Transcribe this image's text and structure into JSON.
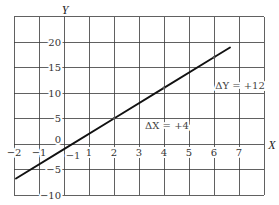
{
  "chart_data": {
    "type": "line",
    "title": "",
    "xlabel": "X",
    "ylabel": "Y",
    "xlim": [
      -2,
      8
    ],
    "ylim": [
      -10,
      25
    ],
    "grid": true,
    "grid_x_step": 1,
    "grid_y_step": 5,
    "x_ticks": [
      {
        "value": -2,
        "label": "−2"
      },
      {
        "value": -1,
        "label": "−1"
      },
      {
        "value": 1,
        "label": "1"
      },
      {
        "value": 2,
        "label": "2"
      },
      {
        "value": 3,
        "label": "3"
      },
      {
        "value": 4,
        "label": "4"
      },
      {
        "value": 5,
        "label": "5"
      },
      {
        "value": 6,
        "label": "6"
      },
      {
        "value": 7,
        "label": "7"
      }
    ],
    "y_ticks": [
      {
        "value": 20,
        "label": "20"
      },
      {
        "value": 15,
        "label": "15"
      },
      {
        "value": 10,
        "label": "10"
      },
      {
        "value": 5,
        "label": "5"
      },
      {
        "value": 0,
        "label": "0"
      },
      {
        "value": -5,
        "label": "−5"
      },
      {
        "value": -10,
        "label": "−10"
      }
    ],
    "series": [
      {
        "name": "line",
        "color": "#111111",
        "x": [
          -1.92,
          0,
          2,
          4,
          6,
          6.64
        ],
        "y": [
          -6.76,
          -1,
          5,
          11,
          17,
          18.92
        ]
      }
    ],
    "marked_points": [
      {
        "x": 2,
        "y": 5
      },
      {
        "x": 4,
        "y": 11
      },
      {
        "x": 6,
        "y": 17
      }
    ],
    "annotations": [
      {
        "id": "delta-y",
        "text": "ΔY = +12",
        "x": 7.04,
        "y": 11.4
      },
      {
        "id": "delta-x",
        "text": "ΔX = +4",
        "x": 4.12,
        "y": 3.7
      },
      {
        "id": "y-intercept",
        "text": "−1",
        "x": 0.36,
        "y": -2.2
      }
    ],
    "legend": null
  }
}
